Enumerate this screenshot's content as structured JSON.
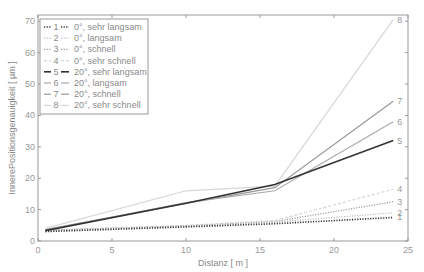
{
  "chart_data": {
    "type": "line",
    "title": "",
    "xlabel": "Distanz [ m ]",
    "ylabel": "InnerePositionsgenauigkeit [ µm ]",
    "xlim": [
      0,
      25
    ],
    "ylim": [
      0,
      72
    ],
    "xticks": [
      0,
      5,
      10,
      15,
      20,
      25
    ],
    "yticks": [
      0,
      10,
      20,
      30,
      40,
      50,
      60,
      70
    ],
    "grid": false,
    "legend_position": "upper left",
    "x": [
      0.5,
      10,
      16,
      24
    ],
    "series": [
      {
        "id": "1",
        "name": "0°, sehr langsam",
        "values": [
          3.0,
          4.5,
          5.5,
          7.5
        ],
        "color": "#333333",
        "style": "dotted",
        "width": 1.6
      },
      {
        "id": "2",
        "name": "0°, langsam",
        "values": [
          3.2,
          4.6,
          6.0,
          9.0
        ],
        "color": "#bbbbbb",
        "style": "dotted",
        "width": 1.2
      },
      {
        "id": "3",
        "name": "0°, schnell",
        "values": [
          3.4,
          4.8,
          6.2,
          12.5
        ],
        "color": "#999999",
        "style": "dotted",
        "width": 1.2
      },
      {
        "id": "4",
        "name": "0°, sehr schnell",
        "values": [
          3.5,
          5.0,
          6.5,
          16.5
        ],
        "color": "#d6d6d6",
        "style": "dashed",
        "width": 1.2
      },
      {
        "id": "5",
        "name": "20°, sehr langsam",
        "values": [
          3.3,
          12.0,
          18.0,
          32.0
        ],
        "color": "#333333",
        "style": "solid",
        "width": 1.6
      },
      {
        "id": "6",
        "name": "20°, langsam",
        "values": [
          3.5,
          12.2,
          16.0,
          38.0
        ],
        "color": "#aaaaaa",
        "style": "solid",
        "width": 1.2
      },
      {
        "id": "7",
        "name": "20°, schnell",
        "values": [
          3.6,
          12.0,
          17.0,
          44.5
        ],
        "color": "#999999",
        "style": "solid",
        "width": 1.2
      },
      {
        "id": "8",
        "name": "20°, sehr schnell",
        "values": [
          4.0,
          16.0,
          17.5,
          70.5
        ],
        "color": "#d6d6d6",
        "style": "solid",
        "width": 1.2
      }
    ]
  }
}
